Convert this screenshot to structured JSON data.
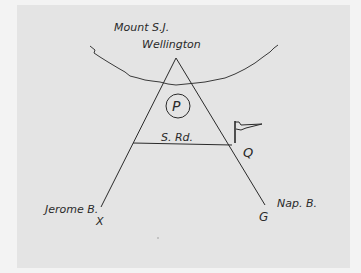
{
  "diagram": {
    "labels": {
      "mountain_line1": "Mount S.J.",
      "mountain_line2": "Wellington",
      "parking": "P",
      "road": "S. Rd.",
      "point_q": "Q",
      "left_branch": "Jerome B.",
      "point_x": "X",
      "right_branch": "Nap. B.",
      "point_g": "G"
    },
    "elements": [
      {
        "type": "curve",
        "name": "mountain-ridge"
      },
      {
        "type": "triangle",
        "name": "peak-paths"
      },
      {
        "type": "circle",
        "name": "parking-marker",
        "label": "P"
      },
      {
        "type": "line",
        "name": "road",
        "label": "S. Rd."
      },
      {
        "type": "flag",
        "name": "flag-marker"
      }
    ],
    "colors": {
      "ink": "#2a2a2a",
      "paper": "#e4e4e4",
      "background": "#f3f3f3"
    }
  }
}
